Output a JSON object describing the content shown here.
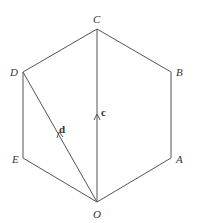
{
  "diagram": {
    "vertices": [
      {
        "name": "O",
        "x": 97,
        "y": 202
      },
      {
        "name": "A",
        "x": 171,
        "y": 158
      },
      {
        "name": "B",
        "x": 171,
        "y": 72
      },
      {
        "name": "C",
        "x": 97,
        "y": 29
      },
      {
        "name": "D",
        "x": 23,
        "y": 72
      },
      {
        "name": "E",
        "x": 23,
        "y": 158
      }
    ],
    "labels": {
      "O": "O",
      "A": "A",
      "B": "B",
      "C": "C",
      "D": "D",
      "E": "E"
    },
    "vectors": [
      {
        "name": "c",
        "from": "O",
        "to": "C",
        "label": "c"
      },
      {
        "name": "d",
        "from": "O",
        "to": "D",
        "label": "d"
      }
    ],
    "colors": {
      "line": "#555555",
      "text": "#333333",
      "background": "#ffffff"
    }
  }
}
